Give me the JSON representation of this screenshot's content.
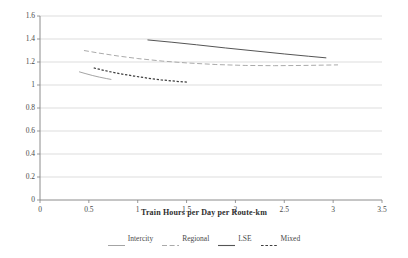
{
  "chart_data": {
    "type": "line",
    "title": "",
    "xlabel": "Train Hours per Day per Route-km",
    "ylabel": "",
    "xlim": [
      0,
      3.5
    ],
    "ylim": [
      0,
      1.6
    ],
    "xticks": [
      "0",
      "0.5",
      "1",
      "1.5",
      "2",
      "2.5",
      "3",
      "3.5"
    ],
    "xtick_values": [
      0,
      0.5,
      1,
      1.5,
      2,
      2.5,
      3,
      3.5
    ],
    "yticks": [
      "0",
      "0.2",
      "0.4",
      "0.6",
      "0.8",
      "1",
      "1.2",
      "1.4",
      "1.6"
    ],
    "ytick_values": [
      0,
      0.2,
      0.4,
      0.6,
      0.8,
      1,
      1.2,
      1.4,
      1.6
    ],
    "grid": "horizontal",
    "legend_position": "bottom",
    "series": [
      {
        "name": "Intercity",
        "style": "solid-light",
        "color": "#9a9a9a",
        "points": [
          [
            0.4,
            1.115
          ],
          [
            0.47,
            1.098
          ],
          [
            0.54,
            1.082
          ],
          [
            0.61,
            1.068
          ],
          [
            0.68,
            1.056
          ],
          [
            0.73,
            1.048
          ]
        ]
      },
      {
        "name": "Regional",
        "style": "dashed",
        "color": "#a0a0a0",
        "points": [
          [
            0.45,
            1.3
          ],
          [
            0.6,
            1.278
          ],
          [
            0.8,
            1.252
          ],
          [
            1.0,
            1.23
          ],
          [
            1.25,
            1.208
          ],
          [
            1.5,
            1.192
          ],
          [
            1.8,
            1.178
          ],
          [
            2.1,
            1.17
          ],
          [
            2.4,
            1.168
          ],
          [
            2.7,
            1.17
          ],
          [
            3.05,
            1.175
          ]
        ]
      },
      {
        "name": "LSE",
        "style": "solid-dark",
        "color": "#555555",
        "points": [
          [
            1.1,
            1.392
          ],
          [
            1.35,
            1.372
          ],
          [
            1.6,
            1.35
          ],
          [
            1.9,
            1.322
          ],
          [
            2.2,
            1.296
          ],
          [
            2.5,
            1.27
          ],
          [
            2.75,
            1.25
          ],
          [
            2.93,
            1.236
          ]
        ]
      },
      {
        "name": "Mixed",
        "style": "dotted",
        "color": "#3f3f3f",
        "points": [
          [
            0.55,
            1.148
          ],
          [
            0.68,
            1.122
          ],
          [
            0.82,
            1.098
          ],
          [
            0.96,
            1.078
          ],
          [
            1.1,
            1.06
          ],
          [
            1.24,
            1.045
          ],
          [
            1.38,
            1.033
          ],
          [
            1.52,
            1.024
          ]
        ]
      }
    ]
  },
  "legend": {
    "items": [
      {
        "label": "Intercity",
        "swatch": "solid-light"
      },
      {
        "label": "Regional",
        "swatch": "dashed"
      },
      {
        "label": "LSE",
        "swatch": "solid-dark"
      },
      {
        "label": "Mixed",
        "swatch": "dotted"
      }
    ]
  },
  "colors": {
    "axis": "#808080",
    "grid": "#cfcfcf",
    "text": "#4a4a4a",
    "background": "#ffffff"
  }
}
